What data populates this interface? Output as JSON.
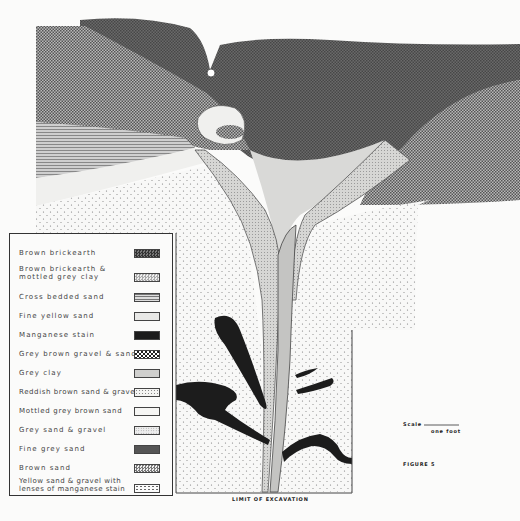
{
  "figure": {
    "label": "FIGURE 5",
    "scale_label": "Scale",
    "scale_unit": "one foot",
    "base_caption": "LIMIT OF EXCAVATION"
  },
  "legend": {
    "items": [
      {
        "label": "Brown brickearth",
        "pattern": "dense-dark-check"
      },
      {
        "label": "Brown brickearth &\nmottled grey clay",
        "pattern": "light-dots"
      },
      {
        "label": "Cross bedded sand",
        "pattern": "horizontal-lines"
      },
      {
        "label": "Fine yellow sand",
        "pattern": "light-fine"
      },
      {
        "label": "Manganese stain",
        "pattern": "solid-black"
      },
      {
        "label": "Grey brown gravel & sand",
        "pattern": "coarse-check"
      },
      {
        "label": "Grey clay",
        "pattern": "light-grey"
      },
      {
        "label": "Reddish brown sand & gravel",
        "pattern": "open-dots"
      },
      {
        "label": "Mottled grey brown sand",
        "pattern": "blank"
      },
      {
        "label": "Grey sand & gravel",
        "pattern": "fine-dots"
      },
      {
        "label": "Fine grey sand",
        "pattern": "dark-grey"
      },
      {
        "label": "Brown sand",
        "pattern": "medium-check"
      },
      {
        "label": "Yellow sand & gravel with\nlenses of manganese stain",
        "pattern": "sparse-dots"
      }
    ]
  },
  "colors": {
    "paper": "#fbfbfa",
    "brickearth": "#5a5a5a",
    "gravel": "#8e8e8e",
    "manganese": "#1c1c1c",
    "ink": "#333333"
  }
}
